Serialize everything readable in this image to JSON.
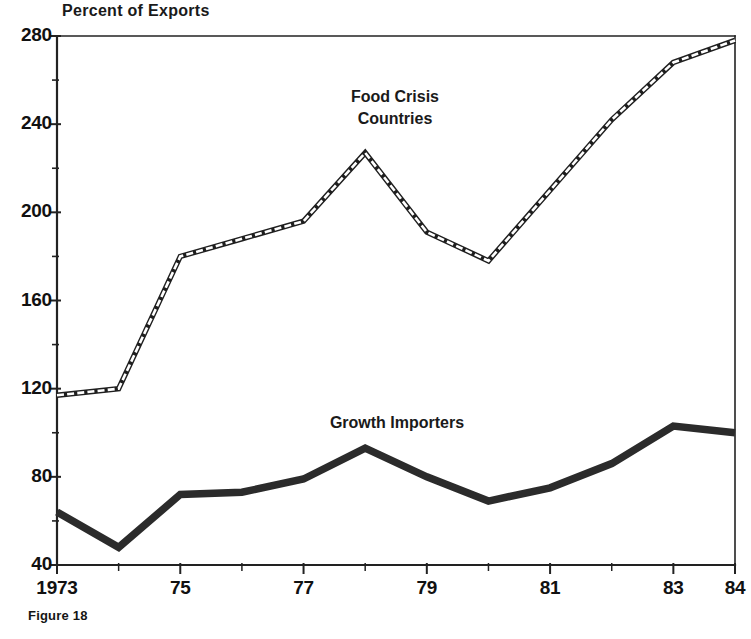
{
  "figure": {
    "caption": "Figure 18",
    "axis_title": "Percent of Exports"
  },
  "chart_data": {
    "type": "line",
    "title": "Percent of Exports",
    "xlabel": "",
    "ylabel": "Percent of Exports",
    "x": [
      1973,
      1974,
      1975,
      1976,
      1977,
      1978,
      1979,
      1980,
      1981,
      1982,
      1983,
      1984
    ],
    "xtick_labels": [
      "1973",
      "",
      "75",
      "",
      "77",
      "",
      "79",
      "",
      "81",
      "",
      "83",
      "84"
    ],
    "xlim": [
      1973,
      1984
    ],
    "ylim": [
      40,
      280
    ],
    "ytick_labels": [
      "280",
      "240",
      "200",
      "160",
      "120",
      "80",
      "40"
    ],
    "ytick_values": [
      280,
      240,
      200,
      160,
      120,
      80,
      40
    ],
    "yminor_step": 20,
    "grid": false,
    "legend_position": "inline-annotation",
    "series": [
      {
        "name": "Food Crisis Countries",
        "style": "hollow-dashed",
        "color": "#1f1f1f",
        "values": [
          117,
          120,
          180,
          188,
          196,
          227,
          191,
          178,
          210,
          242,
          268,
          278
        ],
        "label_x": 1979,
        "label_y": 248
      },
      {
        "name": "Growth Importers",
        "style": "thick-solid",
        "color": "#2b2b2b",
        "values": [
          64,
          48,
          72,
          73,
          79,
          93,
          80,
          69,
          75,
          86,
          103,
          100
        ],
        "label_x": 1978.9,
        "label_y": 112
      }
    ],
    "annotations": [
      {
        "text": "Food Crisis",
        "line": 1,
        "series": "Food Crisis Countries"
      },
      {
        "text": "Countries",
        "line": 2,
        "series": "Food Crisis Countries"
      },
      {
        "text": "Growth Importers",
        "line": 1,
        "series": "Growth Importers"
      }
    ]
  }
}
